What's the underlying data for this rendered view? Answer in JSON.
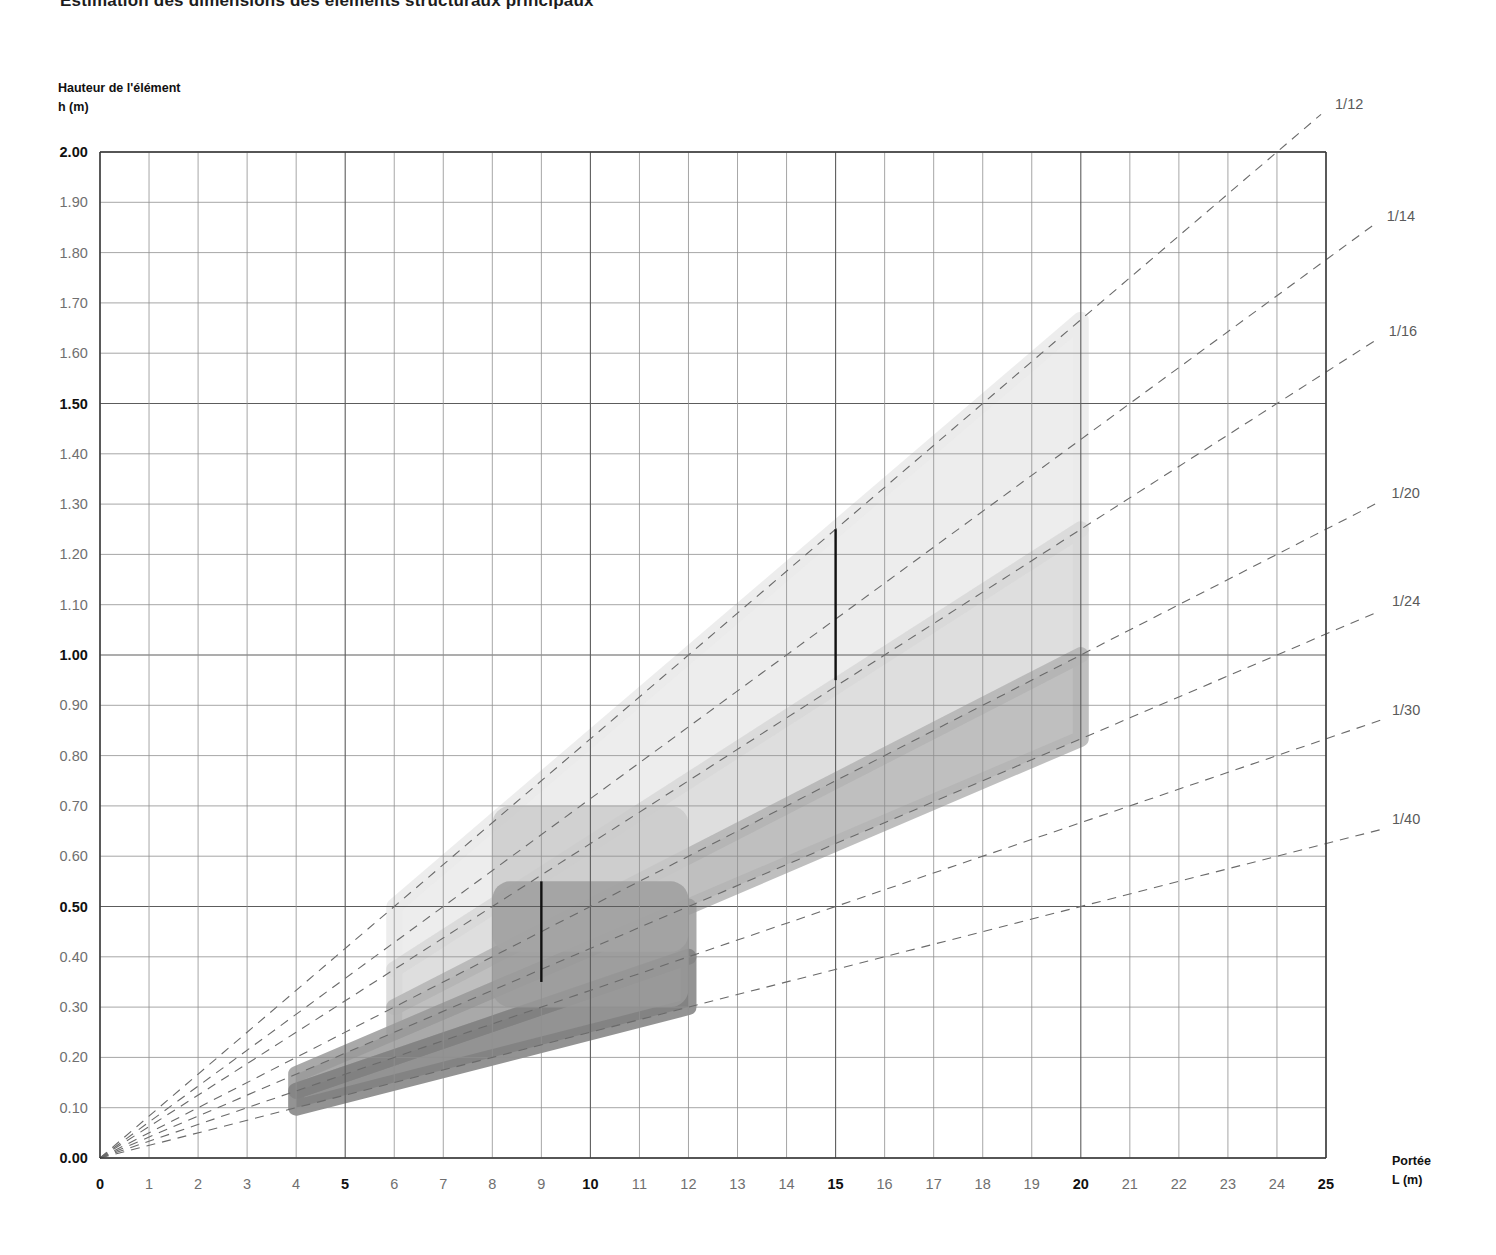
{
  "title": "Estimation des dimensions des éléments structuraux principaux",
  "axes": {
    "y_caption_line1": "Hauteur de l'élément",
    "y_caption_line2": "h (m)",
    "x_caption_line1": "Portée",
    "x_caption_line2": "L (m)"
  },
  "chart_data": {
    "type": "line",
    "title": "Estimation des dimensions des éléments structuraux principaux",
    "xlabel": "Portée L (m)",
    "ylabel": "Hauteur de l'élément h (m)",
    "xlim": [
      0,
      25
    ],
    "ylim": [
      0,
      2.0
    ],
    "grid": true,
    "legend_position": "right-edge-inline",
    "x_ticks": [
      "0",
      "1",
      "2",
      "3",
      "4",
      "5",
      "6",
      "7",
      "8",
      "9",
      "10",
      "11",
      "12",
      "13",
      "14",
      "15",
      "16",
      "17",
      "18",
      "19",
      "20",
      "21",
      "22",
      "23",
      "24",
      "25"
    ],
    "x_major_ticks": [
      "0",
      "5",
      "10",
      "15",
      "20",
      "25"
    ],
    "y_ticks": [
      "0.00",
      "0.10",
      "0.20",
      "0.30",
      "0.40",
      "0.50",
      "0.60",
      "0.70",
      "0.80",
      "0.90",
      "1.00",
      "1.10",
      "1.20",
      "1.30",
      "1.40",
      "1.50",
      "1.60",
      "1.70",
      "1.80",
      "1.90",
      "2.00"
    ],
    "y_major_ticks": [
      "0.00",
      "0.50",
      "1.00",
      "1.50",
      "2.00"
    ],
    "ratio_lines": [
      {
        "label": "1/12",
        "slope": 0.0833333,
        "label_y": 0.0
      },
      {
        "label": "1/14",
        "slope": 0.0714286,
        "label_y": 0.0
      },
      {
        "label": "1/16",
        "slope": 0.0625,
        "label_y": 0.0
      },
      {
        "label": "1/20",
        "slope": 0.05,
        "label_y": 0.0
      },
      {
        "label": "1/24",
        "slope": 0.0416667,
        "label_y": 0.0
      },
      {
        "label": "1/30",
        "slope": 0.0333333,
        "label_y": 0.0
      },
      {
        "label": "1/40",
        "slope": 0.025,
        "label_y": 0.0
      }
    ],
    "bands": [
      {
        "name": "band-lightest",
        "color": "#eaeaea",
        "upper_slope": 0.0833333,
        "lower_slope": 0.0625,
        "x_start": 6,
        "x_end": 20
      },
      {
        "name": "band-light",
        "color": "#d8d8d8",
        "upper_slope": 0.0625,
        "lower_slope": 0.05,
        "x_start": 6,
        "x_end": 20
      },
      {
        "name": "band-mid",
        "color": "#b4b4b4",
        "upper_slope": 0.05,
        "lower_slope": 0.0416667,
        "x_start": 6,
        "x_end": 20
      },
      {
        "name": "band-dark",
        "color": "#9a9a9a",
        "upper_slope": 0.0416667,
        "lower_slope": 0.0333333,
        "x_start": 4,
        "x_end": 12
      },
      {
        "name": "band-darkest",
        "color": "#808080",
        "upper_slope": 0.0333333,
        "lower_slope": 0.025,
        "x_start": 4,
        "x_end": 12
      },
      {
        "name": "band-block-a",
        "color": "#c9c9c9",
        "x_start": 8,
        "x_end": 12,
        "y_low": 0.41,
        "y_high": 0.7
      },
      {
        "name": "band-block-b",
        "color": "#9b9b9b",
        "x_start": 8,
        "x_end": 12,
        "y_low": 0.3,
        "y_high": 0.55
      }
    ],
    "markers": [
      {
        "name": "marker-span-9",
        "x": 9,
        "y_low": 0.35,
        "y_high": 0.55
      },
      {
        "name": "marker-span-15",
        "x": 15,
        "y_low": 0.95,
        "y_high": 1.25
      }
    ]
  }
}
